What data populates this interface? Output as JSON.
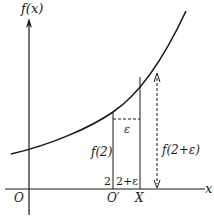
{
  "diagram": {
    "colors": {
      "ink": "#1a1a1a",
      "background": "#ffffff"
    },
    "axes": {
      "y_label": "f(x)",
      "x_label": "x",
      "origin_label": "O"
    },
    "points": {
      "o_prime_label": "O′",
      "x_point_label": "X"
    },
    "tick_labels": {
      "two": "2",
      "two_plus_eps": "2+ε"
    },
    "annotations": {
      "f2": "f(2)",
      "f2_eps": "f(2+ε)",
      "epsilon": "ε"
    }
  }
}
